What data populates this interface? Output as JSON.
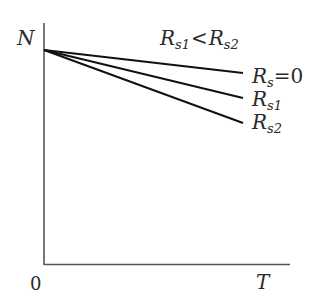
{
  "diagram": {
    "y_axis_label": "N",
    "x_axis_label": "T",
    "origin_label": "0",
    "condition": {
      "r1_main": "R",
      "r1_sub": "s1",
      "operator": "<",
      "r2_main": "R",
      "r2_sub": "s2"
    },
    "lines": [
      {
        "name": "Rs=0",
        "main": "R",
        "sub": "s",
        "suffix": "=0",
        "start": [
          44,
          50
        ],
        "end": [
          243,
          73
        ]
      },
      {
        "name": "Rs1",
        "main": "R",
        "sub": "s1",
        "suffix": "",
        "start": [
          44,
          50
        ],
        "end": [
          243,
          98
        ]
      },
      {
        "name": "Rs2",
        "main": "R",
        "sub": "s2",
        "suffix": "",
        "start": [
          44,
          50
        ],
        "end": [
          243,
          123
        ]
      }
    ],
    "colors": {
      "line": "#111111",
      "axis": "#444444",
      "text": "#2a2a2a"
    }
  }
}
